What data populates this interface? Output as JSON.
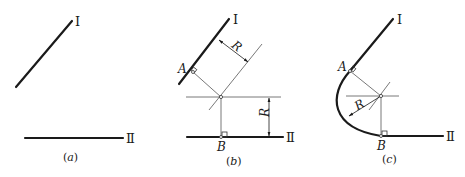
{
  "figure": {
    "panels": [
      {
        "id": "a",
        "caption_open": "(",
        "caption_letter": "a",
        "caption_close": ")",
        "line_labels": {
          "line1": "Ⅰ",
          "line2": "Ⅱ"
        }
      },
      {
        "id": "b",
        "caption_open": "(",
        "caption_letter": "b",
        "caption_close": ")",
        "line_labels": {
          "line1": "Ⅰ",
          "line2": "Ⅱ"
        },
        "point_labels": {
          "tangent1": "A",
          "tangent2": "B"
        },
        "dimension_labels": {
          "offset1": "R",
          "offset2": "R"
        }
      },
      {
        "id": "c",
        "caption_open": "(",
        "caption_letter": "c",
        "caption_close": ")",
        "line_labels": {
          "line1": "Ⅰ",
          "line2": "Ⅱ"
        },
        "point_labels": {
          "tangent1": "A",
          "tangent2": "B"
        },
        "dimension_labels": {
          "radius": "R"
        }
      }
    ],
    "colors": {
      "line": "#1a1a1a",
      "construction": "#555555",
      "background": "#ffffff"
    }
  }
}
